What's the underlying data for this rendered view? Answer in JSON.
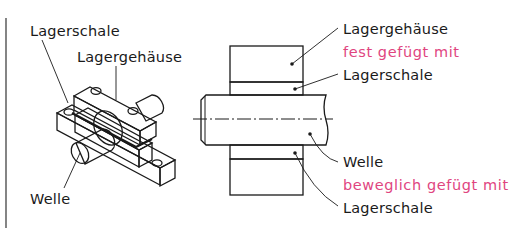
{
  "figure": {
    "left_view": {
      "labels": {
        "shell": "Lagerschale",
        "housing": "Lagergehäuse",
        "shaft": "Welle"
      }
    },
    "section_view": {
      "labels": {
        "housing": "Lagergehäuse",
        "fixed_relation": "fest gefügt mit",
        "shell_top": "Lagerschale",
        "shaft": "Welle",
        "movable_relation": "beweglich gefügt mit",
        "shell_bottom": "Lagerschale"
      }
    },
    "colors": {
      "housing_fill": "#d9d9d9",
      "shell_fill": "#f6dbe9",
      "shaft_fill": "#dff3f7",
      "relation_text": "#e0457f",
      "line": "#1a1a1a"
    }
  }
}
